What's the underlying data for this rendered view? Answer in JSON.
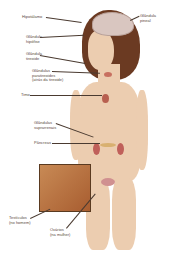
{
  "figure": {
    "labels": {
      "hipotalamo": "Hipotálamo",
      "pineal": "Glândula\npineal",
      "hipofise": "Glândula\nhipófise",
      "tireoide": "Glândula\ntireoide",
      "paratireoides": "Glândulas\nparatireoides\n(atrás da tireoide)",
      "timo": "Timo",
      "suprarrenais": "Glândulas\nsuprarrenais",
      "pancreas": "Pâncreas",
      "testiculos": "Testículos\n(no homem)",
      "ovarios": "Ovários\n(na mulher)"
    },
    "colors": {
      "skin": "#eccdb0",
      "hair": "#6b3a22",
      "brain": "#d9c6c0",
      "organ": "#c0605a",
      "inset": "#b87040"
    }
  }
}
